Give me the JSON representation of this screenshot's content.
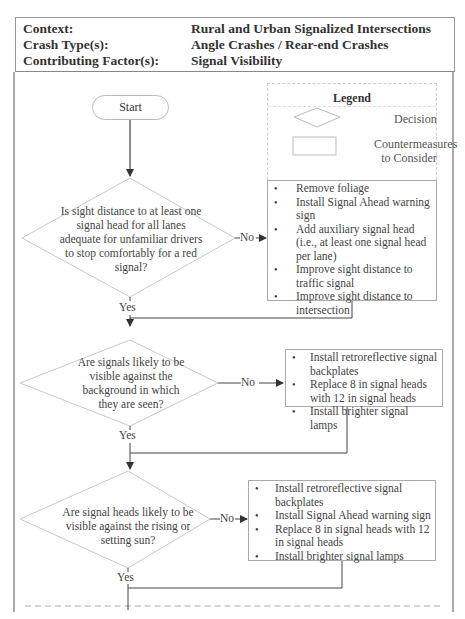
{
  "header": {
    "rows": [
      {
        "label": "Context:",
        "value": "Rural and Urban Signalized Intersections"
      },
      {
        "label": "Crash Type(s):",
        "value": "Angle Crashes / Rear-end Crashes"
      },
      {
        "label": "Contributing Factor(s):",
        "value": "Signal Visibility"
      }
    ]
  },
  "legend": {
    "title": "Legend",
    "decision_label": "Decision",
    "countermeasures_label": "Countermeasures to Consider"
  },
  "flow": {
    "start_label": "Start",
    "yes_label": "Yes",
    "no_label": "No",
    "decisions": [
      {
        "text": "Is sight distance to at least one signal head for all lanes adequate for unfamiliar drivers to stop comfortably for a red signal?",
        "countermeasures": [
          "Remove foliage",
          "Install Signal Ahead warning sign",
          "Add auxiliary signal head (i.e., at least one signal head per lane)",
          "Improve sight distance to traffic signal",
          "Improve sight distance to intersection"
        ]
      },
      {
        "text": "Are signals likely to be visible against the background in which they are seen?",
        "countermeasures": [
          "Install retroreflective signal backplates",
          "Replace 8 in signal heads with 12 in signal heads",
          "Install brighter signal lamps"
        ]
      },
      {
        "text": "Are signal heads likely to be visible against the rising or setting sun?",
        "countermeasures": [
          "Install retroreflective signal backplates",
          "Install Signal Ahead warning sign",
          "Replace 8 in signal heads with 12 in signal heads",
          "Install brighter signal lamps"
        ]
      }
    ]
  }
}
